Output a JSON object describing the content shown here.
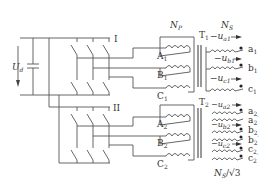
{
  "diagram": {
    "type": "circuit-schematic",
    "title": "",
    "dc_source": {
      "voltage_label": "U",
      "voltage_subscript": "d"
    },
    "inverters": [
      {
        "label": "I"
      },
      {
        "label": "II"
      }
    ],
    "primary": {
      "turns_label": "N",
      "turns_subscript": "P",
      "windings_T1": [
        {
          "label": "A",
          "subscript": "1"
        },
        {
          "label": "B",
          "subscript": "1"
        },
        {
          "label": "C",
          "subscript": "1"
        }
      ],
      "windings_T2": [
        {
          "label": "A",
          "subscript": "2"
        },
        {
          "label": "B",
          "subscript": "2"
        },
        {
          "label": "C",
          "subscript": "2"
        }
      ]
    },
    "secondary": {
      "turns_label": "N",
      "turns_subscript": "S",
      "turns_label_T2": "N",
      "turns_subscript_T2": "S",
      "turns_divisor_T2": "/√3",
      "transformers": [
        {
          "label": "T",
          "subscript": "1",
          "voltages": [
            {
              "sign": "−",
              "label": "u",
              "subscript": "a1"
            },
            {
              "sign": "−",
              "label": "u",
              "subscript": "b1"
            },
            {
              "sign": "−",
              "label": "u",
              "subscript": "c1"
            }
          ],
          "terminals": [
            {
              "label": "a",
              "subscript": "1"
            },
            {
              "label": "b",
              "subscript": "1"
            },
            {
              "label": "c",
              "subscript": "1"
            }
          ]
        },
        {
          "label": "T",
          "subscript": "2",
          "voltages": [
            {
              "sign": "−",
              "label": "u",
              "subscript": "a2"
            },
            {
              "sign": "−",
              "label": "u",
              "subscript": "b2"
            },
            {
              "sign": "−",
              "label": "u",
              "subscript": "c2"
            }
          ],
          "terminals": [
            {
              "label": "a",
              "subscript": "2"
            },
            {
              "label": "a",
              "subscript": "2",
              "prime": "′"
            },
            {
              "label": "b",
              "subscript": "2"
            },
            {
              "label": "b",
              "subscript": "2",
              "prime": "′"
            },
            {
              "label": "c",
              "subscript": "2"
            },
            {
              "label": "c",
              "subscript": "2",
              "prime": "′"
            }
          ]
        }
      ]
    }
  }
}
